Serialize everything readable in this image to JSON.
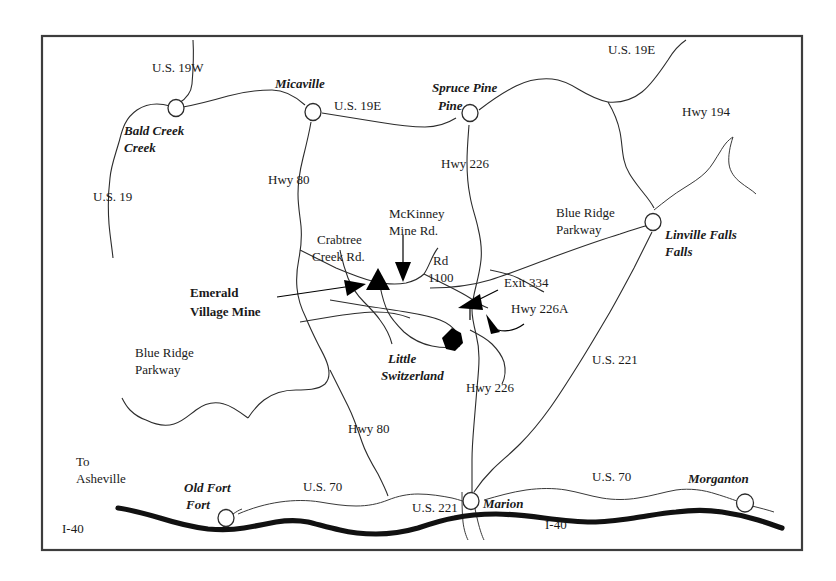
{
  "map": {
    "title": "Emerald Village Mine Location Map",
    "region": "Western North Carolina",
    "frame_color": "#3d3d3d",
    "background_color": "#ffffff",
    "road_color": "#2c2c2c",
    "interstate_color": "#111111",
    "marker_color": "#000000",
    "towns": [
      {
        "name": "Bald Creek",
        "x": 176,
        "y": 108,
        "label_x": 124,
        "label_y": 135,
        "label_line2": "Creek",
        "style": "italic"
      },
      {
        "name": "Micaville",
        "x": 313,
        "y": 112,
        "label_x": 275,
        "label_y": 88,
        "style": "italic"
      },
      {
        "name": "Spruce Pine",
        "x": 470,
        "y": 113,
        "label_x": 432,
        "label_y": 92,
        "label_line2": "Pine",
        "style": "italic"
      },
      {
        "name": "Linville Falls",
        "x": 653,
        "y": 222,
        "label_x": 665,
        "label_y": 239,
        "label_line2": "Falls",
        "style": "italic"
      },
      {
        "name": "Old Fort",
        "x": 226,
        "y": 518,
        "label_x": 184,
        "label_y": 492,
        "label_line2": "Fort",
        "style": "italic"
      },
      {
        "name": "Marion",
        "x": 471,
        "y": 501,
        "label_x": 483,
        "label_y": 508,
        "style": "italic"
      },
      {
        "name": "Morganton",
        "x": 745,
        "y": 503,
        "label_x": 688,
        "label_y": 483,
        "style": "italic"
      }
    ],
    "highway_labels": [
      {
        "text": "U.S. 19W",
        "x": 152,
        "y": 72
      },
      {
        "text": "U.S. 19E",
        "x": 334,
        "y": 110
      },
      {
        "text": "U.S. 19E",
        "x": 608,
        "y": 54
      },
      {
        "text": "Hwy 194",
        "x": 682,
        "y": 116
      },
      {
        "text": "U.S. 19",
        "x": 93,
        "y": 201
      },
      {
        "text": "Hwy 80",
        "x": 268,
        "y": 184
      },
      {
        "text": "Hwy 226",
        "x": 441,
        "y": 168
      },
      {
        "text": "Hwy 80",
        "x": 348,
        "y": 433
      },
      {
        "text": "Hwy 226",
        "x": 466,
        "y": 392
      },
      {
        "text": "U.S. 221",
        "x": 592,
        "y": 364
      },
      {
        "text": "U.S. 70",
        "x": 303,
        "y": 491
      },
      {
        "text": "U.S. 70",
        "x": 592,
        "y": 481
      },
      {
        "text": "U.S. 221",
        "x": 412,
        "y": 512
      },
      {
        "text": "I-40",
        "x": 62,
        "y": 533
      },
      {
        "text": "I-40",
        "x": 545,
        "y": 529
      },
      {
        "text": "Exit 334",
        "x": 504,
        "y": 287
      },
      {
        "text": "Hwy 226A",
        "x": 511,
        "y": 313
      },
      {
        "text": "Rd",
        "x": 433,
        "y": 265,
        "line2": "1100"
      }
    ],
    "place_labels": [
      {
        "text": "Blue Ridge",
        "x": 556,
        "y": 217,
        "line2": "Parkway"
      },
      {
        "text": "Blue Ridge",
        "x": 135,
        "y": 357,
        "line2": "Parkway"
      },
      {
        "text": "McKinney",
        "x": 389,
        "y": 218,
        "line2": "Mine Rd."
      },
      {
        "text": "Crabtree",
        "x": 317,
        "y": 244,
        "line2": "Creek Rd."
      },
      {
        "text": "To",
        "x": 76,
        "y": 466,
        "line2": "Asheville"
      }
    ],
    "italic_labels": [
      {
        "text": "Little",
        "x": 388,
        "y": 363,
        "line2": "Switzerland"
      }
    ],
    "callout": {
      "label_line1": "Emerald",
      "label_line2": "Village Mine",
      "label_x": 190,
      "label_y": 297,
      "arrow_tip_x": 362,
      "arrow_tip_y": 292
    },
    "markers": [
      {
        "name": "emerald-village-mine-triangle",
        "shape": "triangle",
        "x": 378,
        "y": 280
      },
      {
        "name": "little-switzerland-dot",
        "shape": "hexagon",
        "x": 452,
        "y": 340
      }
    ]
  }
}
